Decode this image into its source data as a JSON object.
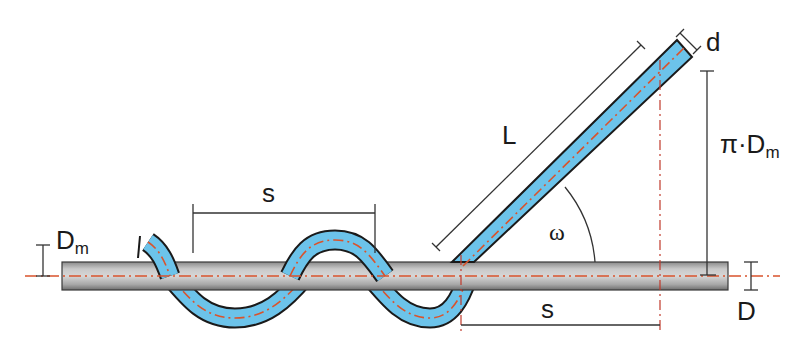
{
  "diagram": {
    "type": "helical wire wrapping geometry",
    "colors": {
      "wire_fill": "#6cc3ea",
      "wire_outline": "#1a1a1a",
      "rod_light": "#cfcfcf",
      "rod_dark": "#7a7a7a",
      "centerline": "#d9532c",
      "dimension_line": "#333333",
      "background": "#ffffff"
    },
    "labels": {
      "pitch_top": "s",
      "pitch_bottom": "s",
      "length": "L",
      "wire_diameter": "d",
      "circumference": "π·D",
      "circumference_sub": "m",
      "helix_angle": "ω",
      "rod_diameter": "D",
      "mean_diameter": "D",
      "mean_diameter_sub": "m"
    },
    "elements": {
      "core_rod": "horizontal cylinder (diameter D)",
      "helical_wire": "wire of diameter d wrapped around rod with pitch s",
      "unrolled_wire": "straight developed length L at helix angle ω",
      "triangle_legs": [
        "s",
        "π·Dm"
      ]
    }
  }
}
